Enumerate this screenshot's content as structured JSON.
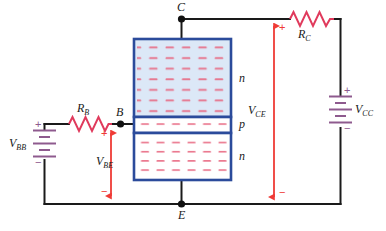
{
  "diagram": {
    "colors": {
      "wire": "#1a1a1a",
      "resistor": "#e03a5c",
      "arrow": "#ef3b36",
      "battery": "#8e5a8e",
      "block_border": "#2b4b9b",
      "n_region_fill": "#dce8f7",
      "p_region_fill": "#ffffff",
      "carrier_dash": "#e8657f"
    },
    "nodes": [
      {
        "id": "collector",
        "label": "C"
      },
      {
        "id": "base",
        "label": "B"
      },
      {
        "id": "emitter",
        "label": "E"
      }
    ],
    "regions": [
      {
        "id": "region-top",
        "label": "n",
        "type": "n"
      },
      {
        "id": "region-middle",
        "label": "p",
        "type": "p"
      },
      {
        "id": "region-bottom",
        "label": "n",
        "type": "n"
      }
    ],
    "resistors": [
      {
        "id": "rb",
        "label": "R",
        "sub": "B"
      },
      {
        "id": "rc",
        "label": "R",
        "sub": "C"
      }
    ],
    "sources": [
      {
        "id": "vbb",
        "label": "V",
        "sub": "BB",
        "plus": "+",
        "minus": "−"
      },
      {
        "id": "vcc",
        "label": "V",
        "sub": "CC",
        "plus": "+",
        "minus": "−"
      }
    ],
    "voltages": [
      {
        "id": "vbe",
        "label": "V",
        "sub": "BE",
        "plus": "+",
        "minus": "−"
      },
      {
        "id": "vce",
        "label": "V",
        "sub": "CE",
        "plus": "+",
        "minus": "−"
      }
    ]
  }
}
